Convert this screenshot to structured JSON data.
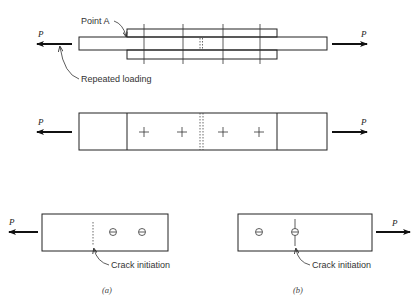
{
  "figure": {
    "top": {
      "load_left": "P",
      "load_right": "P",
      "point_label": "Point A",
      "loading_label": "Repeated loading"
    },
    "middle": {
      "load_left": "P",
      "load_right": "P"
    },
    "panel_a": {
      "load": "P",
      "crack_label": "Crack initiation",
      "caption": "(a)"
    },
    "panel_b": {
      "load": "P",
      "crack_label": "Crack initiation",
      "caption": "(b)"
    }
  }
}
